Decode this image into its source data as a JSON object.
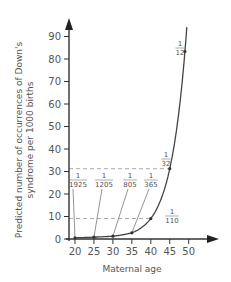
{
  "chart_data": {
    "type": "line",
    "title": "",
    "xlabel": "Maternal age",
    "ylabel": "Predicted number of occurrences of Down's syndrome per 1000 births",
    "ylabel_lines": [
      "Predicted number of occurrences of Down's",
      "syndrome per 1000 births"
    ],
    "xlim": [
      19,
      55
    ],
    "ylim": [
      0,
      97
    ],
    "x_ticks": [
      20,
      25,
      30,
      35,
      40,
      45,
      50
    ],
    "y_ticks": [
      0,
      10,
      20,
      30,
      40,
      50,
      60,
      70,
      80,
      90
    ],
    "grid": false,
    "series": [
      {
        "name": "Predicted occurrences per 1000 births",
        "x": [
          20,
          25,
          30,
          35,
          40,
          45,
          49
        ],
        "y": [
          0.52,
          0.83,
          1.24,
          2.74,
          9.09,
          31.25,
          83.33
        ]
      }
    ],
    "annotations": [
      {
        "age": 20,
        "label_num": "1",
        "label_den": "1925",
        "value": 0.52
      },
      {
        "age": 25,
        "label_num": "1",
        "label_den": "1205",
        "value": 0.83
      },
      {
        "age": 30,
        "label_num": "1",
        "label_den": "805",
        "value": 1.24
      },
      {
        "age": 35,
        "label_num": "1",
        "label_den": "365",
        "value": 2.74
      },
      {
        "age": 40,
        "label_num": "1",
        "label_den": "110",
        "value": 9.09
      },
      {
        "age": 45,
        "label_num": "1",
        "label_den": "32",
        "value": 31.25
      },
      {
        "age": 49,
        "label_num": "1",
        "label_den": "12",
        "value": 83.33
      }
    ],
    "reference_lines": [
      {
        "type": "horizontal-dashed",
        "y": 31.25,
        "to_age": 45
      },
      {
        "type": "horizontal-dashed",
        "y": 9.09,
        "to_age": 40
      }
    ]
  },
  "colors": {
    "axis": "#333333",
    "curve": "#444444",
    "text": "#555555",
    "dashed": "#aaaaaa"
  }
}
